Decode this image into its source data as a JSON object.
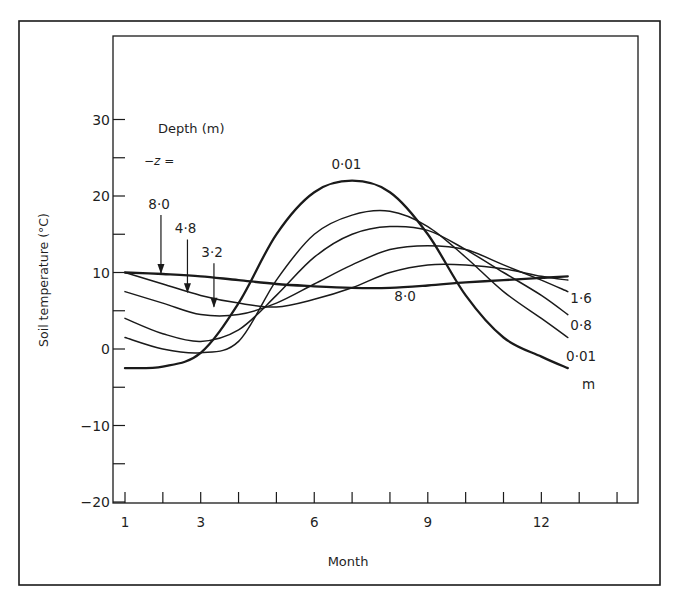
{
  "chart_data": {
    "type": "line",
    "title": "",
    "xlabel": "Month",
    "ylabel": "Soil temperature (°C)",
    "xlim": [
      0.9,
      14.5
    ],
    "ylim": [
      -20,
      38
    ],
    "x_ticks": [
      1,
      2,
      3,
      4,
      5,
      6,
      7,
      8,
      9,
      10,
      11,
      12,
      13,
      14
    ],
    "x_tick_labels": [
      {
        "value": 1,
        "label": "1"
      },
      {
        "value": 3,
        "label": "3"
      },
      {
        "value": 6,
        "label": "6"
      },
      {
        "value": 9,
        "label": "9"
      },
      {
        "value": 12,
        "label": "12"
      }
    ],
    "y_ticks": [
      -20,
      -15,
      -10,
      -5,
      0,
      5,
      10,
      15,
      20,
      25,
      30
    ],
    "y_tick_labels": [
      {
        "value": 30,
        "label": "30"
      },
      {
        "value": 20,
        "label": "20"
      },
      {
        "value": 10,
        "label": "10"
      },
      {
        "value": 0,
        "label": "0"
      },
      {
        "value": -10,
        "label": "-10"
      },
      {
        "value": -20,
        "label": "-20"
      }
    ],
    "grid": false,
    "legend": {
      "title": "Depth (m)",
      "subtitle": "−z =",
      "unit_label": "m"
    },
    "x": [
      1,
      2,
      3,
      4,
      5,
      6,
      7,
      8,
      9,
      10,
      11,
      12,
      12.7
    ],
    "series": [
      {
        "name": "0.01",
        "label": "0·01",
        "bold": true,
        "values": [
          -2.5,
          -2.3,
          -0.5,
          6,
          15,
          20.5,
          22,
          20.5,
          15,
          7,
          1.5,
          -1,
          -2.5
        ]
      },
      {
        "name": "0.8",
        "label": "0·8",
        "bold": false,
        "values": [
          1.5,
          0,
          -0.5,
          1,
          9,
          15,
          17.5,
          18,
          16,
          12,
          7.5,
          4,
          1.5
        ]
      },
      {
        "name": "1.6",
        "label": "1·6",
        "bold": false,
        "values": [
          4,
          2,
          1,
          2.5,
          7,
          12,
          15,
          16,
          15.5,
          13,
          10,
          7,
          4.5
        ]
      },
      {
        "name": "3.2",
        "label": "3·2",
        "bold": false,
        "values": [
          7.5,
          6,
          4.5,
          4.5,
          6,
          8.5,
          11,
          13,
          13.5,
          13,
          11,
          9,
          7.5
        ]
      },
      {
        "name": "4.8",
        "label": "4·8",
        "bold": false,
        "values": [
          10,
          8.5,
          7,
          6,
          5.5,
          6.5,
          8,
          10,
          11,
          11,
          10.5,
          9.5,
          9
        ]
      },
      {
        "name": "8.0",
        "label": "8·0",
        "bold": true,
        "values": [
          10,
          9.8,
          9.5,
          9,
          8.5,
          8.2,
          8,
          8,
          8.3,
          8.7,
          9,
          9.3,
          9.5
        ]
      }
    ],
    "annotations": [
      {
        "text": "0·01",
        "x": 6.85,
        "y": 23.5,
        "target": "0.01 peak label"
      },
      {
        "text": "8·0",
        "x": 8.4,
        "y": 6.3,
        "target": "8.0 curve label"
      },
      {
        "text": "8·0",
        "x": 1.9,
        "y": 18.3,
        "arrow_to": [
          1.95,
          9.8
        ]
      },
      {
        "text": "4·8",
        "x": 2.6,
        "y": 15.1,
        "arrow_to": [
          2.65,
          7.3
        ]
      },
      {
        "text": "3·2",
        "x": 3.3,
        "y": 12.0,
        "arrow_to": [
          3.35,
          5.4
        ]
      },
      {
        "text": "1·6",
        "x": 13.05,
        "y": 6.0
      },
      {
        "text": "0·8",
        "x": 13.05,
        "y": 2.5
      },
      {
        "text": "0·01",
        "x": 13.05,
        "y": -1.6
      },
      {
        "text": "m",
        "x": 13.25,
        "y": -5.2
      }
    ]
  }
}
